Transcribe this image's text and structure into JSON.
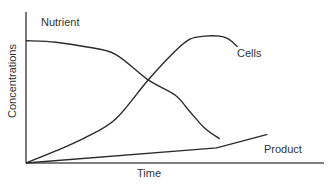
{
  "chart_data": {
    "type": "line",
    "title": "",
    "xlabel": "Time",
    "ylabel": "Concentrations",
    "xlim": [
      0,
      100
    ],
    "ylim": [
      0,
      100
    ],
    "grid": false,
    "ticks": "none",
    "legend": "inline-labels",
    "series": [
      {
        "name": "Nutrient",
        "label": "Nutrient",
        "x": [
          0,
          10,
          20,
          30,
          41,
          50,
          55,
          60,
          65
        ],
        "y": [
          81,
          80,
          77,
          72,
          55,
          45,
          34,
          23,
          16
        ]
      },
      {
        "name": "Cells",
        "label": "Cells",
        "x": [
          0,
          10,
          20,
          30,
          41,
          50,
          55,
          60,
          65,
          68,
          71
        ],
        "y": [
          0,
          8,
          17,
          29,
          55,
          74,
          82,
          84,
          84,
          82,
          77
        ]
      },
      {
        "name": "Product",
        "label": "Product",
        "x": [
          0,
          64,
          81
        ],
        "y": [
          0,
          10,
          19
        ]
      }
    ],
    "annotations": [
      "Nutrient",
      "Cells",
      "Product"
    ]
  }
}
